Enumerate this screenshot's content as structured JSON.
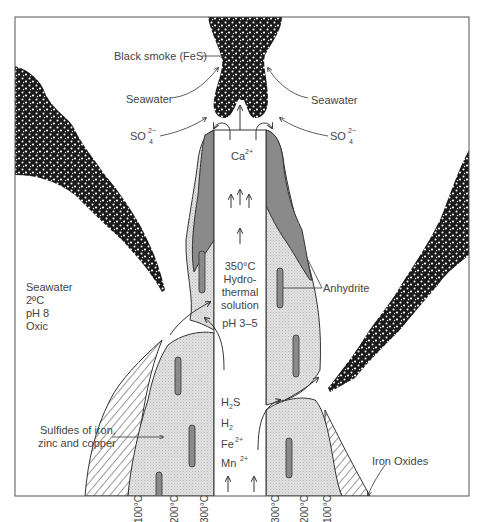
{
  "figure": {
    "labels": {
      "black_smoke": "Black smoke (FeS)",
      "seawater_left": "Seawater",
      "seawater_right": "Seawater",
      "sulfate_left": "SO",
      "sulfate_right": "SO",
      "sulfate_sub": "4",
      "sulfate_sup": "2−",
      "calcium": "Ca",
      "calcium_sup": "2+",
      "hydrothermal": [
        "350°C",
        "Hydro-",
        "thermal",
        "solution",
        "pH 3–5"
      ],
      "ambient_seawater": [
        "Seawater",
        "2ºC",
        "pH 8",
        "Oxic"
      ],
      "anhydrite": "Anhydrite",
      "sulfides": [
        "Sulfides of iron,",
        "zinc and copper"
      ],
      "iron_oxides": "Iron Oxides",
      "species": {
        "h2s": {
          "base": "H",
          "sub": "2",
          "tail": "S"
        },
        "h2": {
          "base": "H",
          "sub": "2"
        },
        "fe": {
          "base": "Fe",
          "sup": "2+"
        },
        "mn": {
          "base": "Mn",
          "sup": "2+"
        }
      }
    },
    "isotherms_left": [
      "100°C",
      "200°C",
      "300°C"
    ],
    "isotherms_right": [
      "300°C",
      "200°C",
      "100°C"
    ],
    "colors": {
      "frame": "#555555",
      "anhydrite_fill": "#8a8a8a",
      "sulfide_fill": "#dcdcdc",
      "smoke": "#1a1a1a",
      "text": "#444444",
      "line": "#333333"
    }
  }
}
